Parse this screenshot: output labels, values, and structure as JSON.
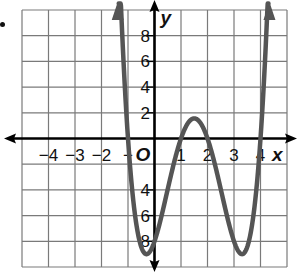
{
  "chart_data": {
    "type": "line",
    "title": "",
    "xlabel": "x",
    "ylabel": "y",
    "function": "y = (x + 1)(x - 1)(x - 2)(x - 4)",
    "xlim": [
      -5,
      5
    ],
    "ylim": [
      -10,
      10
    ],
    "grid": true,
    "x_ticks": [
      -4,
      -3,
      -2,
      -1,
      1,
      2,
      3,
      4
    ],
    "x_tick_labels": [
      "−4",
      "−3",
      "−2",
      "−",
      "1",
      "2",
      "3",
      "4"
    ],
    "y_ticks": [
      8,
      6,
      4,
      2,
      -4,
      -6,
      -8
    ],
    "y_tick_labels": [
      "8",
      "6",
      "4",
      "2",
      "4",
      "6",
      "8"
    ],
    "origin_label": "O",
    "x_intercepts": [
      -1,
      1,
      2,
      4
    ],
    "y_intercept": -8,
    "local_max": {
      "x": 1.5,
      "y": 1.6
    },
    "local_minima": [
      {
        "x": -0.2,
        "y": -8.9
      },
      {
        "x": 3.3,
        "y": -9.0
      }
    ],
    "series": [
      {
        "name": "f(x)",
        "color": "#555555",
        "x": [
          -1.35,
          -1.2,
          -1.0,
          -0.8,
          -0.6,
          -0.4,
          -0.2,
          0.0,
          0.2,
          0.4,
          0.6,
          0.8,
          1.0,
          1.2,
          1.4,
          1.5,
          1.6,
          1.8,
          2.0,
          2.2,
          2.4,
          2.6,
          2.8,
          3.0,
          3.2,
          3.4,
          3.6,
          3.8,
          4.0,
          4.2,
          4.3
        ],
        "values": [
          9.6,
          4.6,
          0,
          -3.4,
          -5.7,
          -7.3,
          -8.9,
          -8.0,
          -7.5,
          -6.1,
          -4.3,
          -2.4,
          0,
          1.1,
          1.5,
          1.6,
          1.5,
          0.9,
          0,
          -1.2,
          -3.3,
          -5.5,
          -7.4,
          -8.0,
          -9.0,
          -8.7,
          -7.6,
          -5.4,
          0,
          4.5,
          9.3
        ]
      }
    ],
    "colors": {
      "grid": "#7a7a7a",
      "axes": "#000000",
      "curve": "#555555"
    }
  },
  "labels": {
    "x_axis": "x",
    "y_axis": "y",
    "origin": "O"
  }
}
